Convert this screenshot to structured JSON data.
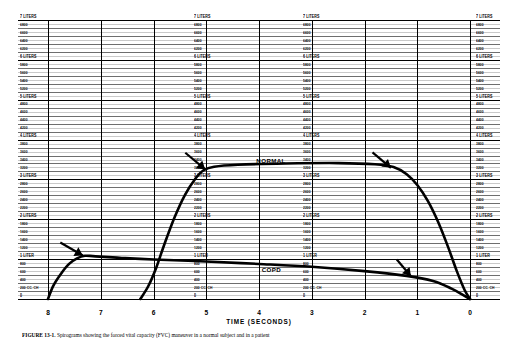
{
  "figure": {
    "caption_bold": "FIGURE 13-1.",
    "caption_rest": "  Spirograms showing the forced vital capacity (FVC) maneuver in a normal subject and in a patient",
    "background": "#ffffff",
    "ink_color": "#000000",
    "grid_color": "#6e6e6e"
  },
  "axes": {
    "x": {
      "title": "TIME (SECONDS)",
      "ticks": [
        "8",
        "7",
        "6",
        "5",
        "4",
        "3",
        "2",
        "1",
        "0"
      ],
      "direction": "right-to-left",
      "min": 0,
      "max": 8
    },
    "y": {
      "unit": "cc",
      "min": 0,
      "max": 7000,
      "minor_step": 200,
      "labels": [
        "7 LITERS",
        "6800",
        "6600",
        "6400",
        "6200",
        "6 LITERS",
        "5800",
        "5600",
        "5400",
        "5200",
        "5 LITERS",
        "4800",
        "4600",
        "4400",
        "4200",
        "4 LITERS",
        "3800",
        "3600",
        "3400",
        "3200",
        "3 LITERS",
        "2800",
        "2600",
        "2400",
        "2200",
        "2 LITERS",
        "1800",
        "1600",
        "1400",
        "1200",
        "1 LITER",
        "800",
        "600",
        "400",
        "200 CC. CH",
        "0"
      ],
      "major_labels": [
        "7 LITERS",
        "6 LITERS",
        "5 LITERS",
        "4 LITERS",
        "3 LITERS",
        "2 LITERS",
        "1 LITER",
        "0"
      ]
    }
  },
  "annotations": {
    "normal_label": "NORMAL",
    "copd_label": "COPD"
  },
  "chart_data": {
    "type": "line",
    "title": "",
    "xlabel": "TIME (SECONDS)",
    "ylabel": "",
    "xlim": [
      8,
      0
    ],
    "ylim": [
      0,
      7000
    ],
    "grid": true,
    "legend": "inline-annotations",
    "series": [
      {
        "name": "NORMAL",
        "label_position": {
          "time": 4.05,
          "volume": 3450
        },
        "arrow_at": {
          "time": 5.0,
          "volume": 3300
        },
        "points": [
          {
            "time": 6.25,
            "volume": 0
          },
          {
            "time": 6.1,
            "volume": 320
          },
          {
            "time": 5.95,
            "volume": 780
          },
          {
            "time": 5.8,
            "volume": 1350
          },
          {
            "time": 5.6,
            "volume": 2050
          },
          {
            "time": 5.4,
            "volume": 2620
          },
          {
            "time": 5.2,
            "volume": 3030
          },
          {
            "time": 5.05,
            "volume": 3230
          },
          {
            "time": 4.85,
            "volume": 3320
          },
          {
            "time": 4.4,
            "volume": 3370
          },
          {
            "time": 3.5,
            "volume": 3400
          },
          {
            "time": 2.5,
            "volume": 3410
          },
          {
            "time": 1.8,
            "volume": 3380
          },
          {
            "time": 1.45,
            "volume": 3310
          },
          {
            "time": 1.2,
            "volume": 3130
          },
          {
            "time": 1.0,
            "volume": 2860
          },
          {
            "time": 0.8,
            "volume": 2460
          },
          {
            "time": 0.6,
            "volume": 1920
          },
          {
            "time": 0.42,
            "volume": 1320
          },
          {
            "time": 0.25,
            "volume": 700
          },
          {
            "time": 0.1,
            "volume": 220
          },
          {
            "time": 0.0,
            "volume": 0
          }
        ]
      },
      {
        "name": "COPD",
        "label_position": {
          "time": 3.95,
          "volume": 740
        },
        "arrow_at": {
          "time": 7.35,
          "volume": 1100
        },
        "arrow_at_2": {
          "time": 1.1,
          "volume": 560
        },
        "points": [
          {
            "time": 8.0,
            "volume": 0
          },
          {
            "time": 7.9,
            "volume": 330
          },
          {
            "time": 7.75,
            "volume": 640
          },
          {
            "time": 7.6,
            "volume": 880
          },
          {
            "time": 7.45,
            "volume": 1020
          },
          {
            "time": 7.3,
            "volume": 1085
          },
          {
            "time": 7.1,
            "volume": 1070
          },
          {
            "time": 6.6,
            "volume": 1030
          },
          {
            "time": 6.0,
            "volume": 990
          },
          {
            "time": 5.0,
            "volume": 940
          },
          {
            "time": 4.0,
            "volume": 880
          },
          {
            "time": 3.0,
            "volume": 810
          },
          {
            "time": 2.0,
            "volume": 700
          },
          {
            "time": 1.2,
            "volume": 580
          },
          {
            "time": 0.7,
            "volume": 450
          },
          {
            "time": 0.35,
            "volume": 260
          },
          {
            "time": 0.12,
            "volume": 90
          },
          {
            "time": 0.0,
            "volume": 0
          }
        ]
      }
    ]
  }
}
